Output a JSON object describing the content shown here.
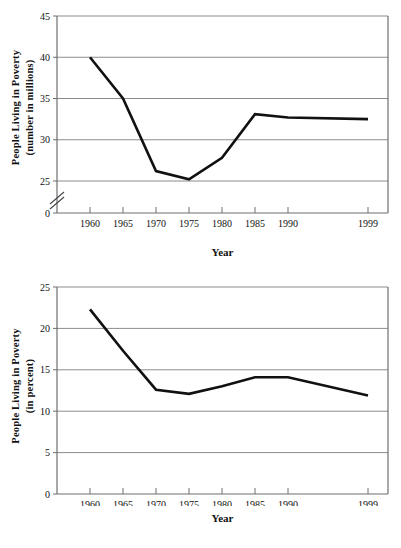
{
  "charts": [
    {
      "id": "poverty-number-millions",
      "ylabel_line1": "People Living in Poverty",
      "ylabel_line2": "(number in millions)",
      "xlabel": "Year"
    },
    {
      "id": "poverty-percent",
      "ylabel_line1": "People Living in Poverty",
      "ylabel_line2": "(in percent)",
      "xlabel": "Year"
    }
  ],
  "chart_data": [
    {
      "type": "line",
      "title": "",
      "xlabel": "Year",
      "ylabel": "People Living in Poverty (number in millions)",
      "x": [
        1960,
        1965,
        1970,
        1975,
        1980,
        1985,
        1990,
        1999
      ],
      "xtick_labels": [
        "1960",
        "1965",
        "1970",
        "1975",
        "1980",
        "1985",
        "1990",
        "1999"
      ],
      "values": [
        40.0,
        35.0,
        26.2,
        25.2,
        27.8,
        33.1,
        32.7,
        32.5
      ],
      "ytick_labels": [
        "0",
        "25",
        "30",
        "35",
        "40",
        "45"
      ],
      "yticks": [
        0,
        25,
        30,
        35,
        40,
        45
      ],
      "ylim": [
        25,
        45
      ],
      "axis_break": true,
      "grid": true,
      "legend": "none",
      "line_color": "#111111",
      "grid_color": "#8c8c8c"
    },
    {
      "type": "line",
      "title": "",
      "xlabel": "Year",
      "ylabel": "People Living in Poverty (in percent)",
      "x": [
        1960,
        1965,
        1970,
        1975,
        1980,
        1985,
        1990,
        1999
      ],
      "xtick_labels": [
        "1960",
        "1965",
        "1970",
        "1975",
        "1980",
        "1985",
        "1990",
        "1999"
      ],
      "values": [
        22.3,
        17.3,
        12.6,
        12.1,
        13.0,
        14.1,
        14.1,
        11.9
      ],
      "ytick_labels": [
        "0",
        "5",
        "10",
        "15",
        "20",
        "25"
      ],
      "yticks": [
        0,
        5,
        10,
        15,
        20,
        25
      ],
      "ylim": [
        0,
        25
      ],
      "axis_break": false,
      "grid": true,
      "legend": "none",
      "line_color": "#111111",
      "grid_color": "#8c8c8c"
    }
  ]
}
